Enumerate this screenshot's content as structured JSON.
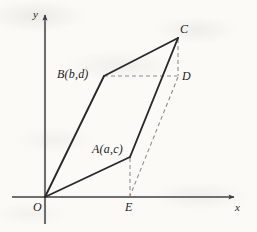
{
  "figure": {
    "background_color": "#fbfaf7",
    "stroke_color": "#2a2a2a",
    "axis_color": "#6f6f6f",
    "dashed_color": "#8a8a8a",
    "axes": {
      "y_axis_label": "y",
      "x_axis_label": "x",
      "origin_label": "O"
    },
    "points": [
      {
        "id": "O",
        "label": "O",
        "x": 45,
        "y": 197
      },
      {
        "id": "A",
        "label": "A(a,c)",
        "x": 130,
        "y": 157
      },
      {
        "id": "B",
        "label": "B(b,d)",
        "x": 104,
        "y": 76
      },
      {
        "id": "C",
        "label": "C",
        "x": 178,
        "y": 38
      },
      {
        "id": "D",
        "label": "D",
        "x": 178,
        "y": 76
      },
      {
        "id": "E",
        "label": "E",
        "x": 130,
        "y": 197
      }
    ],
    "solid_edges": [
      {
        "from": "O",
        "to": "A"
      },
      {
        "from": "A",
        "to": "C"
      },
      {
        "from": "C",
        "to": "B"
      },
      {
        "from": "B",
        "to": "O"
      }
    ],
    "dashed_edges": [
      {
        "from": "B",
        "to": "D"
      },
      {
        "from": "C",
        "to": "D"
      },
      {
        "from": "A",
        "to": "E"
      },
      {
        "from": "D",
        "to": "E"
      }
    ],
    "labels": {
      "y_axis": "y",
      "x_axis": "x",
      "O": "O",
      "A": "A(a,c)",
      "B": "B(b,d)",
      "C": "C",
      "D": "D",
      "E": "E"
    }
  }
}
